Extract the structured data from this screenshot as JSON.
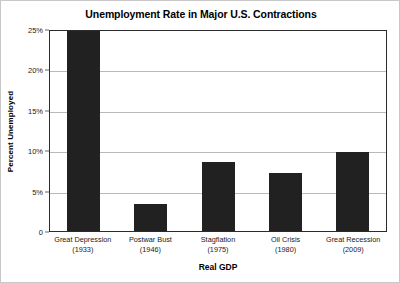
{
  "chart_data": {
    "type": "bar",
    "title": "Unemployment Rate in Major U.S. Contractions",
    "xlabel": "Real GDP",
    "ylabel": "Percent Unemployed",
    "categories": [
      "Great Depression",
      "Postwar Bust",
      "Stagflation",
      "Oil Crisis",
      "Great Recession"
    ],
    "category_years": [
      "(1933)",
      "(1946)",
      "(1975)",
      "(1980)",
      "(2009)"
    ],
    "values": [
      24.7,
      3.4,
      8.6,
      7.2,
      9.8
    ],
    "ylim": [
      0,
      25
    ],
    "yticks": [
      25,
      20,
      15,
      10,
      5,
      0
    ],
    "ytick_labels": [
      "25%",
      "20%",
      "15%",
      "10%",
      "5%",
      "0"
    ],
    "grid": "horizontal",
    "legend": "none",
    "bar_color": "#212121",
    "gridline_color": "#b9b9b9",
    "axis_color": "#2b2b2b",
    "background_color": "#ffffff"
  }
}
